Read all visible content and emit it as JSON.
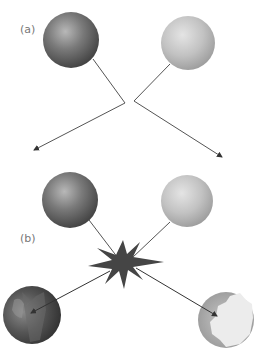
{
  "panels": {
    "a": {
      "label": "(a)"
    },
    "b": {
      "label": "(b)"
    }
  },
  "caption": {
    "text": ""
  },
  "colors": {
    "dark_sphere": "#5a5a5a",
    "light_sphere": "#bdbdbd",
    "line": "#555555",
    "starburst": "#454545",
    "background": "#ffffff"
  },
  "elements": {
    "panel_a": {
      "spheres": [
        {
          "name": "dark",
          "cx": 71,
          "cy": 40,
          "r": 28
        },
        {
          "name": "light",
          "cx": 188,
          "cy": 43,
          "r": 27
        }
      ],
      "paths": [
        {
          "from": [
            93,
            59
          ],
          "via": [
            125,
            103
          ],
          "to": [
            34,
            150
          ]
        },
        {
          "from": [
            170,
            64
          ],
          "via": [
            134,
            101
          ],
          "to": [
            222,
            157
          ]
        }
      ]
    },
    "panel_b": {
      "spheres": [
        {
          "name": "dark",
          "cx": 70,
          "cy": 200,
          "r": 28
        },
        {
          "name": "light",
          "cx": 187,
          "cy": 201,
          "r": 26
        }
      ],
      "starburst": {
        "cx": 123,
        "cy": 263
      },
      "fragments": [
        {
          "name": "dark-broken",
          "cx": 32,
          "cy": 315,
          "r": 29
        },
        {
          "name": "light-broken",
          "cx": 226,
          "cy": 320,
          "r": 28
        }
      ]
    }
  }
}
